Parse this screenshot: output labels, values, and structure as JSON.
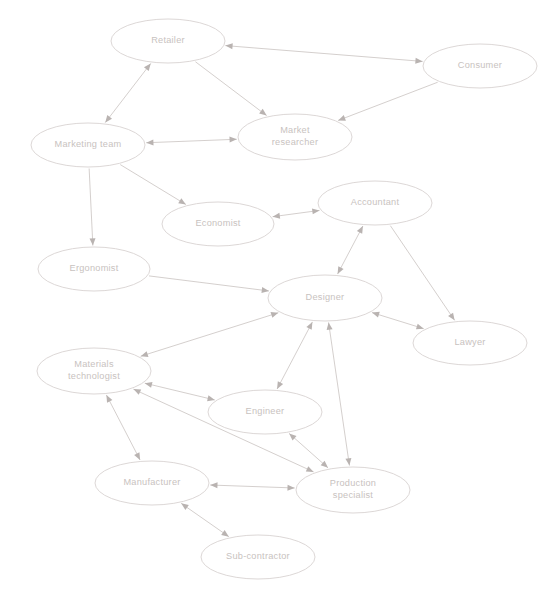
{
  "diagram": {
    "type": "directed-graph",
    "background_color": "#ffffff",
    "node_fill": "#ffffff",
    "node_stroke": "#d8d3d1",
    "edge_color": "#cfc9c7",
    "arrow_color": "#b9b3b1",
    "label_color": "#c8c2c0",
    "top_artifact_text": "",
    "nodes": [
      {
        "id": "retailer",
        "label": "Retailer",
        "lines": [
          "Retailer"
        ],
        "cx": 168,
        "cy": 41,
        "rx": 57,
        "ry": 22
      },
      {
        "id": "consumer",
        "label": "Consumer",
        "lines": [
          "Consumer"
        ],
        "cx": 480,
        "cy": 66,
        "rx": 57,
        "ry": 22
      },
      {
        "id": "market-researcher",
        "label": "Market researcher",
        "lines": [
          "Market",
          "researcher"
        ],
        "cx": 295,
        "cy": 137,
        "rx": 57,
        "ry": 23
      },
      {
        "id": "marketing-team",
        "label": "Marketing team",
        "lines": [
          "Marketing team"
        ],
        "cx": 88,
        "cy": 145,
        "rx": 57,
        "ry": 22
      },
      {
        "id": "economist",
        "label": "Economist",
        "lines": [
          "Economist"
        ],
        "cx": 218,
        "cy": 224,
        "rx": 56,
        "ry": 22
      },
      {
        "id": "accountant",
        "label": "Accountant",
        "lines": [
          "Accountant"
        ],
        "cx": 375,
        "cy": 203,
        "rx": 57,
        "ry": 22
      },
      {
        "id": "ergonomist",
        "label": "Ergonomist",
        "lines": [
          "Ergonomist"
        ],
        "cx": 94,
        "cy": 269,
        "rx": 56,
        "ry": 22
      },
      {
        "id": "designer",
        "label": "Designer",
        "lines": [
          "Designer"
        ],
        "cx": 325,
        "cy": 298,
        "rx": 57,
        "ry": 23
      },
      {
        "id": "lawyer",
        "label": "Lawyer",
        "lines": [
          "Lawyer"
        ],
        "cx": 470,
        "cy": 343,
        "rx": 57,
        "ry": 22
      },
      {
        "id": "materials-technologist",
        "label": "Materials technologist",
        "lines": [
          "Materials",
          "technologist"
        ],
        "cx": 94,
        "cy": 371,
        "rx": 57,
        "ry": 23
      },
      {
        "id": "engineer",
        "label": "Engineer",
        "lines": [
          "Engineer"
        ],
        "cx": 265,
        "cy": 412,
        "rx": 57,
        "ry": 22
      },
      {
        "id": "manufacturer",
        "label": "Manufacturer",
        "lines": [
          "Manufacturer"
        ],
        "cx": 152,
        "cy": 483,
        "rx": 57,
        "ry": 22
      },
      {
        "id": "production-specialist",
        "label": "Production specialist",
        "lines": [
          "Production",
          "specialist"
        ],
        "cx": 353,
        "cy": 490,
        "rx": 57,
        "ry": 23
      },
      {
        "id": "sub-contractor",
        "label": "Sub-contractor",
        "lines": [
          "Sub-contractor"
        ],
        "cx": 258,
        "cy": 557,
        "rx": 57,
        "ry": 22
      }
    ],
    "edges": [
      {
        "from": "retailer",
        "to": "consumer",
        "direction": "both"
      },
      {
        "from": "retailer",
        "to": "marketing-team",
        "direction": "both"
      },
      {
        "from": "retailer",
        "to": "market-researcher",
        "direction": "forward"
      },
      {
        "from": "consumer",
        "to": "market-researcher",
        "direction": "forward"
      },
      {
        "from": "marketing-team",
        "to": "market-researcher",
        "direction": "both"
      },
      {
        "from": "marketing-team",
        "to": "economist",
        "direction": "forward"
      },
      {
        "from": "marketing-team",
        "to": "ergonomist",
        "direction": "forward"
      },
      {
        "from": "economist",
        "to": "accountant",
        "direction": "both"
      },
      {
        "from": "accountant",
        "to": "designer",
        "direction": "both"
      },
      {
        "from": "accountant",
        "to": "lawyer",
        "direction": "forward"
      },
      {
        "from": "ergonomist",
        "to": "designer",
        "direction": "forward"
      },
      {
        "from": "designer",
        "to": "lawyer",
        "direction": "both"
      },
      {
        "from": "designer",
        "to": "materials-technologist",
        "direction": "both"
      },
      {
        "from": "designer",
        "to": "engineer",
        "direction": "both"
      },
      {
        "from": "designer",
        "to": "production-specialist",
        "direction": "both"
      },
      {
        "from": "materials-technologist",
        "to": "engineer",
        "direction": "both"
      },
      {
        "from": "materials-technologist",
        "to": "manufacturer",
        "direction": "both"
      },
      {
        "from": "materials-technologist",
        "to": "production-specialist",
        "direction": "both"
      },
      {
        "from": "engineer",
        "to": "production-specialist",
        "direction": "both"
      },
      {
        "from": "manufacturer",
        "to": "production-specialist",
        "direction": "both"
      },
      {
        "from": "manufacturer",
        "to": "sub-contractor",
        "direction": "both"
      }
    ]
  }
}
